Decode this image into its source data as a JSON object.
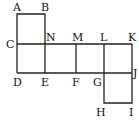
{
  "diagram": {
    "labels": {
      "A": "A",
      "B": "B",
      "C": "C",
      "N": "N",
      "M": "M",
      "L": "L",
      "K": "K",
      "D": "D",
      "E": "E",
      "F": "F",
      "G": "G",
      "J": "J",
      "H": "H",
      "I": "I"
    },
    "line_color": "#222222"
  }
}
